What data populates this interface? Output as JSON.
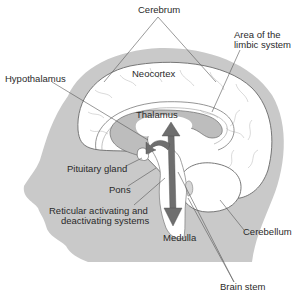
{
  "diagram": {
    "colors": {
      "head_fill": "#c9c9c9",
      "brain_fill": "#ffffff",
      "outline": "#6a6a6a",
      "thalamus_fill": "#bdbdbd",
      "arrow_fill": "#6e6e6e",
      "label_text": "#2a2a2a",
      "leader_line": "#555555"
    },
    "labels": {
      "cerebrum": "Cerebrum",
      "limbic_line1": "Area of the",
      "limbic_line2": "limbic system",
      "hypothalamus": "Hypothalamus",
      "neocortex": "Neocortex",
      "thalamus": "Thalamus",
      "pituitary": "Pituitary gland",
      "pons": "Pons",
      "reticular_line1": "Reticular activating and",
      "reticular_line2": "deactivating systems",
      "medulla": "Medulla",
      "cerebellum": "Cerebellum",
      "brain_stem": "Brain stem"
    }
  }
}
